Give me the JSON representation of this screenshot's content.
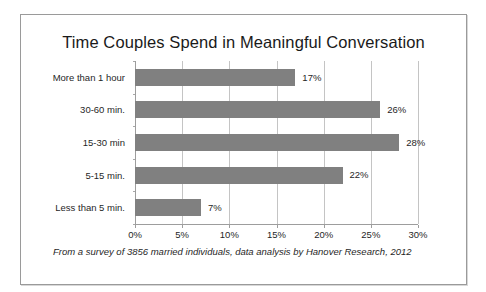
{
  "chart_data": {
    "type": "bar",
    "orientation": "horizontal",
    "title": "Time Couples Spend in Meaningful Conversation",
    "categories": [
      "More than 1 hour",
      "30-60 min.",
      "15-30 min",
      "5-15 min.",
      "Less than 5 min."
    ],
    "values": [
      17,
      26,
      28,
      22,
      7
    ],
    "data_labels": [
      "17%",
      "26%",
      "28%",
      "22%",
      "7%"
    ],
    "xlabel": "",
    "ylabel": "",
    "xlim": [
      0,
      30
    ],
    "xticks": [
      0,
      5,
      10,
      15,
      20,
      25,
      30
    ],
    "xtick_labels": [
      "0%",
      "5%",
      "10%",
      "15%",
      "20%",
      "25%",
      "30%"
    ],
    "grid": true,
    "grid_axis": "x",
    "legend": false,
    "bar_color": "#808080",
    "gridline_color": "#c4c4c4",
    "axis_color": "#9d9d9d",
    "text_color": "#1f1f1f",
    "footnote": "From a survey of 3856 married individuals, data analysis by Hanover Research, 2012"
  }
}
